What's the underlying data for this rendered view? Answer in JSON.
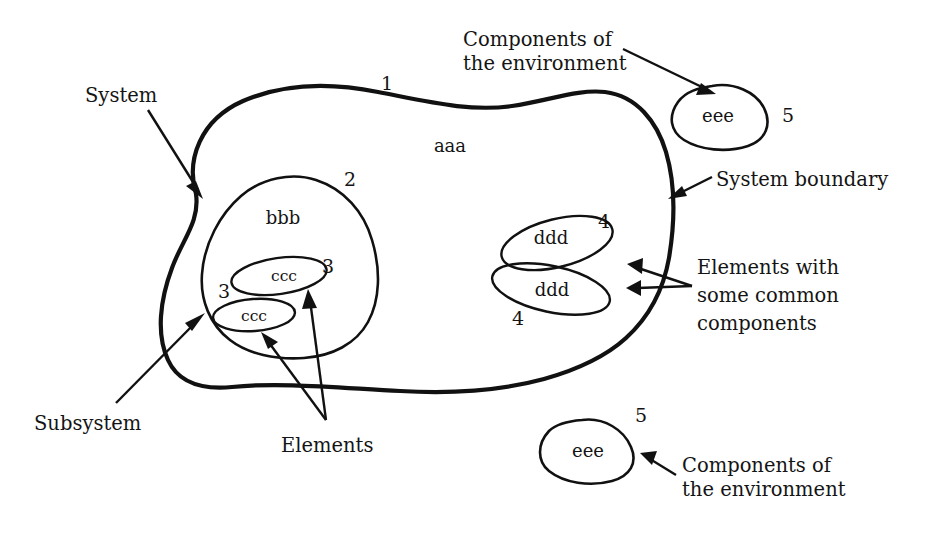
{
  "diagram": {
    "background_color": "#ffffff",
    "stroke_color": "#111111",
    "callouts": {
      "system": "System",
      "subsystem": "Subsystem",
      "elements": "Elements",
      "system_boundary": "System boundary",
      "components_env_top_line1": "Components of",
      "components_env_top_line2": "the environment",
      "components_env_bottom_line1": "Components of",
      "components_env_bottom_line2": "the environment",
      "common_line1": "Elements with",
      "common_line2": "some common",
      "common_line3": "components"
    },
    "shapes": {
      "system": {
        "label": "aaa",
        "number": "1"
      },
      "subsystem": {
        "label": "bbb",
        "number": "2"
      },
      "element_ccc_upper": {
        "label": "ccc",
        "number": "3"
      },
      "element_ccc_lower": {
        "label": "ccc",
        "number": "3"
      },
      "element_ddd_upper": {
        "label": "ddd",
        "number": "4"
      },
      "element_ddd_lower": {
        "label": "ddd",
        "number": "4"
      },
      "env_eee_top": {
        "label": "eee",
        "number": "5"
      },
      "env_eee_bottom": {
        "label": "eee",
        "number": "5"
      }
    }
  }
}
